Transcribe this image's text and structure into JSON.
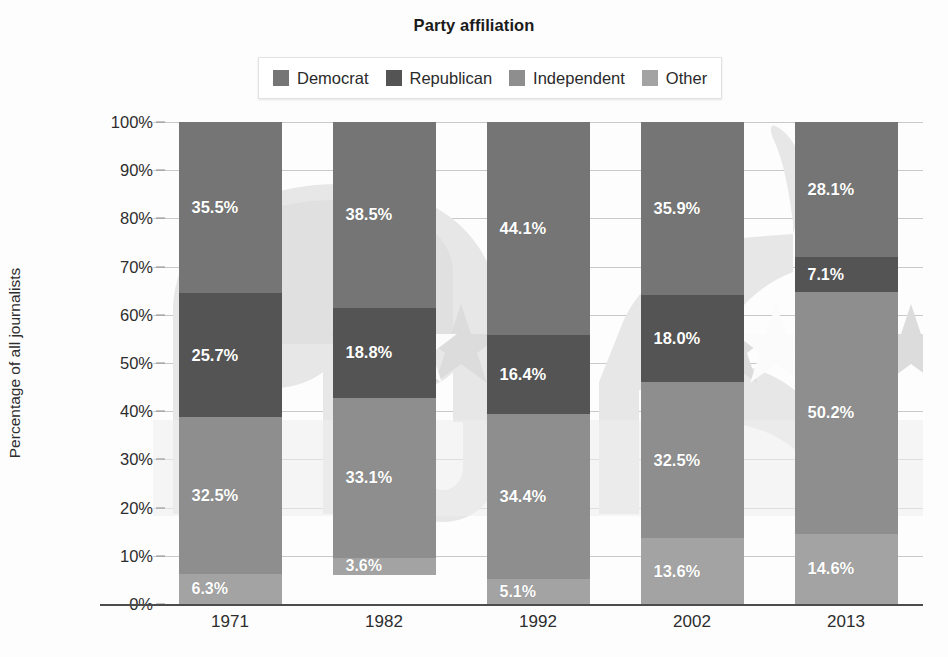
{
  "chart": {
    "title": "Party affiliation",
    "y_axis_title": "Percentage of all journalists"
  },
  "legend": {
    "items": [
      {
        "label": "Democrat",
        "color": "#757575",
        "swatch_name": "legend-swatch-democrat"
      },
      {
        "label": "Republican",
        "color": "#545454",
        "swatch_name": "legend-swatch-republican"
      },
      {
        "label": "Independent",
        "color": "#8e8e8e",
        "swatch_name": "legend-swatch-independent"
      },
      {
        "label": "Other",
        "color": "#a3a3a3",
        "swatch_name": "legend-swatch-other"
      }
    ]
  },
  "y_ticks": [
    "100%",
    "90%",
    "80%",
    "70%",
    "60%",
    "50%",
    "40%",
    "30%",
    "20%",
    "10%",
    "0%"
  ],
  "watermark": {
    "name": "elephant-and-donkey-watermark",
    "color": "#e6e6e6",
    "star_color": "#dcdcdc"
  },
  "chart_data": {
    "type": "bar",
    "subtype": "stacked-100-percent",
    "title": "Party affiliation",
    "xlabel": "",
    "ylabel": "Percentage of all journalists",
    "ylim": [
      0,
      100
    ],
    "ytick_values": [
      0,
      10,
      20,
      30,
      40,
      50,
      60,
      70,
      80,
      90,
      100
    ],
    "grid": true,
    "legend_position": "top-center",
    "categories": [
      "1971",
      "1982",
      "1992",
      "2002",
      "2013"
    ],
    "stack_order_bottom_to_top": [
      "Other",
      "Independent",
      "Republican",
      "Democrat"
    ],
    "series": [
      {
        "name": "Democrat",
        "color": "#757575",
        "values": [
          35.5,
          38.5,
          44.1,
          35.9,
          28.1
        ],
        "labels": [
          "35.5%",
          "38.5%",
          "44.1%",
          "35.9%",
          "28.1%"
        ]
      },
      {
        "name": "Republican",
        "color": "#545454",
        "values": [
          25.7,
          18.8,
          16.4,
          18.0,
          7.1
        ],
        "labels": [
          "25.7%",
          "18.8%",
          "16.4%",
          "18.0%",
          "7.1%"
        ]
      },
      {
        "name": "Independent",
        "color": "#8e8e8e",
        "values": [
          32.5,
          33.1,
          34.4,
          32.5,
          50.2
        ],
        "labels": [
          "32.5%",
          "33.1%",
          "34.4%",
          "32.5%",
          "50.2%"
        ]
      },
      {
        "name": "Other",
        "color": "#a3a3a3",
        "values": [
          6.3,
          3.6,
          5.1,
          13.6,
          14.6
        ],
        "labels": [
          "6.3%",
          "3.6%",
          "5.1%",
          "13.6%",
          "14.6%"
        ]
      }
    ]
  }
}
